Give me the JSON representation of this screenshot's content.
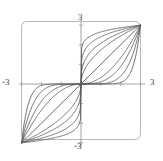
{
  "figure": {
    "name": "family-of-sigmoid-curves-plot",
    "background_color": "#ffffff",
    "frame_color": "#b9b9b9",
    "axis_color": "#9a9a9a",
    "curve_color": "#5a5a5a",
    "diagonal_color": "#5a5a5a",
    "label_color": "#3c3c3c",
    "corner_artifact_text": ""
  },
  "axis_labels": {
    "top": "3",
    "bottom": "-3",
    "left": "-3",
    "right": "3"
  },
  "chart_data": {
    "type": "line",
    "title": "",
    "subtitle": "",
    "xlabel": "",
    "ylabel": "",
    "xlim": [
      -3,
      3
    ],
    "ylim": [
      -3,
      3
    ],
    "grid": false,
    "legend": null,
    "legend_position": "none",
    "x_tick_labels": [
      "-3",
      "3"
    ],
    "y_tick_labels": [
      "-3",
      "3"
    ],
    "x_ticks": [
      -3,
      -2,
      -1,
      1,
      2,
      3
    ],
    "y_ticks": [
      -3,
      -2,
      -1,
      1,
      2,
      3
    ],
    "annotations": [],
    "series": [
      {
        "name": "y = x",
        "kind": "diagonal",
        "exponent": 1,
        "x": [
          -3,
          -2,
          -1,
          0,
          1,
          2,
          3
        ],
        "values": [
          -3,
          -2,
          -1,
          0,
          1,
          2,
          3
        ]
      },
      {
        "name": "k = 2",
        "kind": "sigmoid-above",
        "exponent": 2,
        "x": [
          -3,
          -2.5,
          -2,
          -1.5,
          -1,
          -0.5,
          0,
          0.5,
          1,
          1.5,
          2,
          2.5,
          3
        ],
        "values": [
          -3,
          -2.28,
          -1.66,
          -1.13,
          -0.69,
          -0.31,
          0,
          0.31,
          0.69,
          1.13,
          1.66,
          2.28,
          3
        ]
      },
      {
        "name": "k = 3",
        "kind": "sigmoid-above",
        "exponent": 3,
        "x": [
          -3,
          -2.5,
          -2,
          -1.5,
          -1,
          -0.5,
          0,
          0.5,
          1,
          1.5,
          2,
          2.5,
          3
        ],
        "values": [
          -3,
          -2.6,
          -2.14,
          -1.6,
          -1.02,
          -0.47,
          0,
          0.47,
          1.02,
          1.6,
          2.14,
          2.6,
          3
        ]
      },
      {
        "name": "k = 5",
        "kind": "sigmoid-above",
        "exponent": 5,
        "x": [
          -3,
          -2.5,
          -2,
          -1.5,
          -1,
          -0.5,
          0,
          0.5,
          1,
          1.5,
          2,
          2.5,
          3
        ],
        "values": [
          -3,
          -2.84,
          -2.56,
          -2.11,
          -1.47,
          -0.73,
          0,
          0.73,
          1.47,
          2.11,
          2.56,
          2.84,
          3
        ]
      },
      {
        "name": "k = 9",
        "kind": "sigmoid-above",
        "exponent": 9,
        "x": [
          -3,
          -2.5,
          -2,
          -1.5,
          -1,
          -0.5,
          0,
          0.5,
          1,
          1.5,
          2,
          2.5,
          3
        ],
        "values": [
          -3,
          -2.94,
          -2.8,
          -2.5,
          -1.93,
          -1.05,
          0,
          1.05,
          1.93,
          2.5,
          2.8,
          2.94,
          3
        ]
      },
      {
        "name": "k = 1/2",
        "kind": "sigmoid-below",
        "exponent": 0.5,
        "x": [
          -3,
          -2.28,
          -1.66,
          -1.13,
          -0.69,
          -0.31,
          0,
          0.31,
          0.69,
          1.13,
          1.66,
          2.28,
          3
        ],
        "values": [
          -3,
          -2.5,
          -2,
          -1.5,
          -1,
          -0.5,
          0,
          0.5,
          1,
          1.5,
          2,
          2.5,
          3
        ]
      },
      {
        "name": "k = 1/3",
        "kind": "sigmoid-below",
        "exponent": 0.3333,
        "x": [
          -3,
          -2.6,
          -2.14,
          -1.6,
          -1.02,
          -0.47,
          0,
          0.47,
          1.02,
          1.6,
          2.14,
          2.6,
          3
        ],
        "values": [
          -3,
          -2.5,
          -2,
          -1.5,
          -1,
          -0.5,
          0,
          0.5,
          1,
          1.5,
          2,
          2.5,
          3
        ]
      },
      {
        "name": "k = 1/5",
        "kind": "sigmoid-below",
        "exponent": 0.2,
        "x": [
          -3,
          -2.84,
          -2.56,
          -2.11,
          -1.47,
          -0.73,
          0,
          0.73,
          1.47,
          2.11,
          2.56,
          2.84,
          3
        ],
        "values": [
          -3,
          -2.5,
          -2,
          -1.5,
          -1,
          -0.5,
          0,
          0.5,
          1,
          1.5,
          2,
          2.5,
          3
        ]
      },
      {
        "name": "k = 1/9",
        "kind": "sigmoid-below",
        "exponent": 0.1111,
        "x": [
          -3,
          -2.94,
          -2.8,
          -2.5,
          -1.93,
          -1.05,
          0,
          1.05,
          1.93,
          2.5,
          2.8,
          2.94,
          3
        ],
        "values": [
          -3,
          -2.5,
          -2,
          -1.5,
          -1,
          -0.5,
          0,
          0.5,
          1,
          1.5,
          2,
          2.5,
          3
        ]
      }
    ]
  }
}
